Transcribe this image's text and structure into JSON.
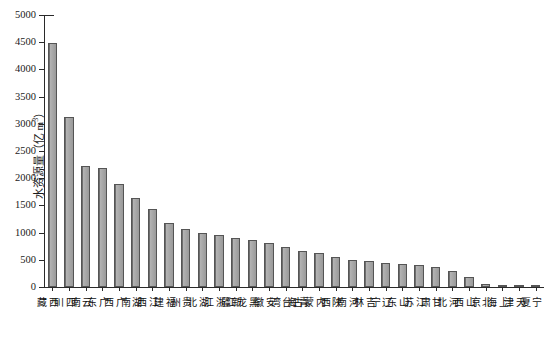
{
  "chart_data": {
    "type": "bar",
    "title": "",
    "xlabel": "",
    "ylabel": "水资源量（亿 m³）",
    "ylabel_main": "水资源量（亿 m",
    "ylabel_sup": "3",
    "ylabel_tail": "）",
    "ylim": [
      0,
      5000
    ],
    "ytick_step": 500,
    "ytick_labels": [
      "0",
      "500",
      "1000",
      "1500",
      "2000",
      "2500",
      "3000",
      "3500",
      "4000",
      "4500",
      "5000"
    ],
    "ytick_values": [
      0,
      500,
      1000,
      1500,
      2000,
      2500,
      3000,
      3500,
      4000,
      4500,
      5000
    ],
    "grid": false,
    "legend": false,
    "bar_color": "#9a9a9a",
    "bar_edge_color": "#555555",
    "axis_color": "#2a2a2a",
    "categories": [
      "西藏",
      "四川",
      "云南",
      "广东",
      "广西",
      "湖南",
      "江西",
      "福建",
      "贵州",
      "湖北",
      "浙江",
      "新疆",
      "黑龙江",
      "安徽",
      "台湾",
      "青海",
      "内蒙古",
      "陕西",
      "河南",
      "吉林",
      "辽宁",
      "山东",
      "江苏",
      "甘肃",
      "河北",
      "山西",
      "北京",
      "上海",
      "天津",
      "宁夏"
    ],
    "values": [
      4490,
      3125,
      2230,
      2180,
      1900,
      1640,
      1430,
      1170,
      1060,
      1000,
      955,
      900,
      860,
      800,
      740,
      660,
      620,
      550,
      490,
      470,
      450,
      420,
      400,
      360,
      290,
      190,
      60,
      45,
      25,
      15
    ]
  }
}
